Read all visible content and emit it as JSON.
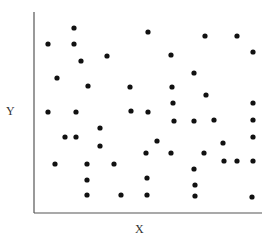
{
  "chart_data": {
    "type": "scatter",
    "title": "",
    "xlabel": "X",
    "ylabel": "Y",
    "grid": false,
    "legend": null,
    "xlim": [
      0,
      228
    ],
    "ylim": [
      0,
      200
    ],
    "axis_color": "#777777",
    "point_color": "#111111",
    "note": "Axes have no ticks or tick labels; values are pixel-relative positions within plot area (origin bottom-left, x: 0-228, y: 0-200).",
    "points": [
      {
        "x": 14,
        "y": 169
      },
      {
        "x": 40,
        "y": 185
      },
      {
        "x": 40,
        "y": 169
      },
      {
        "x": 47,
        "y": 152
      },
      {
        "x": 73,
        "y": 157
      },
      {
        "x": 23,
        "y": 135
      },
      {
        "x": 54,
        "y": 127
      },
      {
        "x": 96,
        "y": 126
      },
      {
        "x": 14,
        "y": 101
      },
      {
        "x": 42,
        "y": 101
      },
      {
        "x": 97,
        "y": 102
      },
      {
        "x": 114,
        "y": 181
      },
      {
        "x": 171,
        "y": 177
      },
      {
        "x": 203,
        "y": 177
      },
      {
        "x": 219,
        "y": 161
      },
      {
        "x": 137,
        "y": 158
      },
      {
        "x": 160,
        "y": 140
      },
      {
        "x": 138,
        "y": 126
      },
      {
        "x": 172,
        "y": 118
      },
      {
        "x": 139,
        "y": 110
      },
      {
        "x": 219,
        "y": 110
      },
      {
        "x": 114,
        "y": 101
      },
      {
        "x": 140,
        "y": 92
      },
      {
        "x": 160,
        "y": 92
      },
      {
        "x": 180,
        "y": 93
      },
      {
        "x": 219,
        "y": 93
      },
      {
        "x": 66,
        "y": 85
      },
      {
        "x": 31,
        "y": 76
      },
      {
        "x": 42,
        "y": 76
      },
      {
        "x": 66,
        "y": 67
      },
      {
        "x": 21,
        "y": 49
      },
      {
        "x": 53,
        "y": 49
      },
      {
        "x": 80,
        "y": 49
      },
      {
        "x": 53,
        "y": 33
      },
      {
        "x": 53,
        "y": 18
      },
      {
        "x": 87,
        "y": 18
      },
      {
        "x": 123,
        "y": 72
      },
      {
        "x": 189,
        "y": 70
      },
      {
        "x": 219,
        "y": 76
      },
      {
        "x": 112,
        "y": 60
      },
      {
        "x": 137,
        "y": 60
      },
      {
        "x": 170,
        "y": 60
      },
      {
        "x": 190,
        "y": 52
      },
      {
        "x": 203,
        "y": 52
      },
      {
        "x": 219,
        "y": 52
      },
      {
        "x": 160,
        "y": 44
      },
      {
        "x": 113,
        "y": 35
      },
      {
        "x": 161,
        "y": 28
      },
      {
        "x": 113,
        "y": 18
      },
      {
        "x": 161,
        "y": 17
      },
      {
        "x": 218,
        "y": 16
      }
    ]
  }
}
